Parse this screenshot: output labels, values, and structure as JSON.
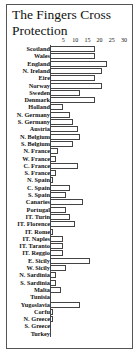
{
  "chart_data": {
    "type": "bar",
    "orientation": "horizontal",
    "title": "The Fingers Cross Protection",
    "xlabel": "",
    "ylabel": "",
    "xlim": [
      0,
      30
    ],
    "x_ticks": [
      "5",
      "10",
      "15",
      "20",
      "25",
      "30"
    ],
    "grid": false,
    "categories": [
      "Scotland",
      "Wales",
      "England",
      "N. Ireland",
      "Eire",
      "Norway",
      "Sweden",
      "Denmark",
      "Holland",
      "N. Germany",
      "S. Germany",
      "Austria",
      "N. Belgium",
      "S. Belgium",
      "N. France",
      "W. France",
      "C. France",
      "S. France",
      "N. Spain",
      "C. Spain",
      "S. Spain",
      "Canaries",
      "Portugal",
      "IT. Turin",
      "IT. Florence",
      "IT. Rome",
      "IT. Naples",
      "IT. Taranto",
      "IT. Reggio",
      "E. Sicily",
      "W. Sicily",
      "N. Sardinia",
      "S. Sardinia",
      "Malta",
      "Tunisia",
      "Yugoslavia",
      "Corfu",
      "N. Greece",
      "S. Greece",
      "Turkey"
    ],
    "values": [
      18,
      18,
      23,
      21,
      18,
      21,
      12,
      18,
      5,
      8,
      9,
      11,
      12,
      9,
      3,
      2,
      11,
      2,
      1,
      8,
      6,
      13,
      6,
      8,
      10,
      1,
      5,
      5,
      5,
      16,
      6,
      2,
      2,
      4,
      0,
      12,
      1,
      1,
      0,
      0
    ]
  }
}
